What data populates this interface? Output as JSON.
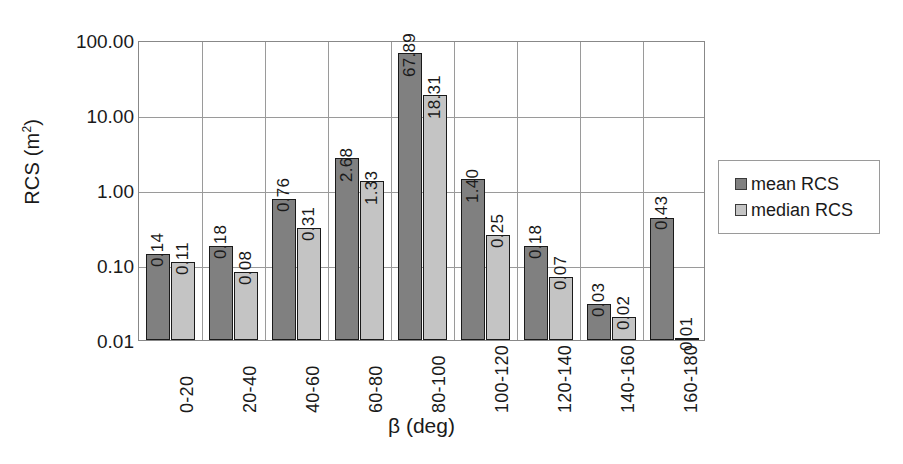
{
  "chart_data": {
    "type": "bar",
    "title": "",
    "xlabel": "β (deg)",
    "ylabel": "RCS (m²)",
    "ylabel_base": "RCS (m",
    "ylabel_sup": "2",
    "ylabel_tail": ")",
    "yscale": "log",
    "ylim": [
      0.01,
      100
    ],
    "ytick_labels": [
      "100.00",
      "10.00",
      "1.00",
      "0.10",
      "0.01"
    ],
    "ytick_values": [
      100,
      10,
      1,
      0.1,
      0.01
    ],
    "grid": true,
    "legend_position": "right",
    "categories": [
      "0-20",
      "20-40",
      "40-60",
      "60-80",
      "80-100",
      "100-120",
      "120-140",
      "140-160",
      "160-180"
    ],
    "series": [
      {
        "name": "mean RCS",
        "color": "#808080",
        "values": [
          0.14,
          0.18,
          0.76,
          2.68,
          67.89,
          1.4,
          0.18,
          0.03,
          0.43
        ],
        "labels": [
          "0.14",
          "0.18",
          "0.76",
          "2.68",
          "67.89",
          "1.40",
          "0.18",
          "0.03",
          "0.43"
        ]
      },
      {
        "name": "median RCS",
        "color": "#c4c4c4",
        "values": [
          0.11,
          0.08,
          0.31,
          1.33,
          18.31,
          0.25,
          0.07,
          0.02,
          0.01
        ],
        "labels": [
          "0.11",
          "0.08",
          "0.31",
          "1.33",
          "18.31",
          "0.25",
          "0.07",
          "0.02",
          "0.01"
        ]
      }
    ]
  },
  "legend": {
    "items": [
      {
        "label": "mean RCS",
        "color": "#808080"
      },
      {
        "label": "median RCS",
        "color": "#c4c4c4"
      }
    ]
  },
  "colors": {
    "mean": "#808080",
    "median": "#c4c4c4",
    "axis": "#888888",
    "grid": "#9a9a9a",
    "text": "#1a1a1a"
  }
}
